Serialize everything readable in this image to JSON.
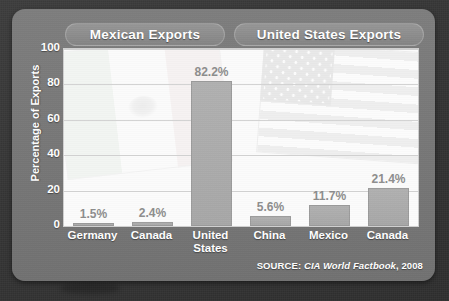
{
  "panel": {
    "headers": [
      {
        "id": "mexico",
        "label": "Mexican Exports"
      },
      {
        "id": "united-states",
        "label": "United States Exports"
      }
    ],
    "source_prefix": "SOURCE: ",
    "source_italic": "CIA World Factbook",
    "source_suffix": ", 2008"
  },
  "colors": {
    "panel_gray": "#787878",
    "pill_gray": "#8d8d8d",
    "bar_gray": "#a7a7a7",
    "plot_bg": "#fbfbfb",
    "gridline": "#d2d2d2",
    "value_text": "#8d8d8d",
    "label_text": "#ffffff",
    "backdrop": "#353535"
  },
  "chart_data": {
    "type": "bar",
    "title": "",
    "subtitle": "",
    "xlabel": "",
    "ylabel": "Percentage of Exports",
    "ylim": [
      0,
      100
    ],
    "yticks": [
      0,
      20,
      40,
      60,
      80,
      100
    ],
    "ytick_labels": [
      "0",
      "20",
      "40",
      "60",
      "80",
      "100"
    ],
    "grid": true,
    "legend": "none",
    "groups": [
      {
        "name": "Mexican Exports",
        "categories": [
          "Germany",
          "Canada",
          "United States"
        ]
      },
      {
        "name": "United States Exports",
        "categories": [
          "China",
          "Mexico",
          "Canada"
        ]
      }
    ],
    "categories": [
      "Germany",
      "Canada",
      "United States",
      "China",
      "Mexico",
      "Canada"
    ],
    "values": [
      1.5,
      2.4,
      82.2,
      5.6,
      11.7,
      21.4
    ],
    "value_labels": [
      "1.5%",
      "2.4%",
      "82.2%",
      "5.6%",
      "11.7%",
      "21.4%"
    ],
    "category_labels": [
      [
        "Germany"
      ],
      [
        "Canada"
      ],
      [
        "United",
        "States"
      ],
      [
        "China"
      ],
      [
        "Mexico"
      ],
      [
        "Canada"
      ]
    ],
    "watermarks": [
      {
        "name": "mexican-flag",
        "group": "Mexican Exports"
      },
      {
        "name": "united-states-flag",
        "group": "United States Exports"
      }
    ]
  }
}
